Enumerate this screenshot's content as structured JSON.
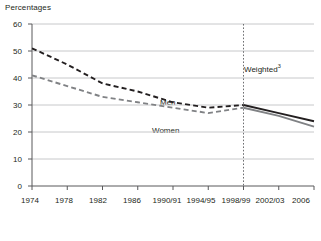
{
  "chart_data": {
    "type": "line",
    "title": "Percentages",
    "xlabel": "",
    "ylabel": "",
    "ylim": [
      0,
      60
    ],
    "ytick_values": [
      0,
      10,
      20,
      30,
      40,
      50,
      60
    ],
    "ytick_labels": [
      "0",
      "10",
      "20",
      "30",
      "40",
      "50",
      "60"
    ],
    "grid": true,
    "legend_position": "inline-labels",
    "categories": [
      "1974",
      "1978",
      "1982",
      "1986",
      "1990/91",
      "1994/95",
      "1998/99",
      "2002/03",
      "2006"
    ],
    "x_index": [
      0,
      1,
      2,
      3,
      4,
      5,
      6,
      7,
      8
    ],
    "series": [
      {
        "name": "Men",
        "color": "#231f20",
        "style_before_break": "dashed",
        "style_after_break": "solid",
        "values": [
          51,
          45,
          38,
          35,
          31,
          29,
          30,
          27,
          24
        ],
        "x": [
          0,
          1,
          2,
          3,
          4,
          5,
          6,
          7,
          8
        ]
      },
      {
        "name": "Women",
        "color": "#808285",
        "style_before_break": "dashed",
        "style_after_break": "solid",
        "values": [
          41,
          37,
          33,
          31,
          29,
          27,
          29,
          26,
          22
        ],
        "x": [
          0,
          1,
          2,
          3,
          4,
          5,
          6,
          7,
          8
        ]
      }
    ],
    "annotations": [
      {
        "name": "weighted-note",
        "text": "Weighted",
        "superscript": "3",
        "x_category": "1998/99",
        "description": "Label to the right of the vertical break line indicating weighted data from 1998/99 onward."
      }
    ],
    "break_line": {
      "name": "weighted-break-line",
      "at_category": "1998/99",
      "style": "dotted",
      "color": "#6d6e71"
    },
    "series_inline_labels": [
      {
        "name": "Men",
        "text": "Men"
      },
      {
        "name": "Women",
        "text": "Women"
      }
    ]
  }
}
